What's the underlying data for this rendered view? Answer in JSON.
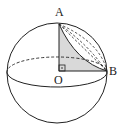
{
  "diagram": {
    "type": "geometry-sphere",
    "labels": {
      "A": "A",
      "O": "O",
      "B": "B"
    },
    "colors": {
      "stroke": "#222222",
      "shaded_triangle": "#d9d9d9",
      "background": "#ffffff"
    },
    "elements": [
      "sphere outline",
      "equator ellipse (back half dashed, front half solid)",
      "right triangle AOB shaded, right angle at O",
      "arc AB on sphere surface",
      "dashed arcs from A to B (great circle section)"
    ]
  }
}
